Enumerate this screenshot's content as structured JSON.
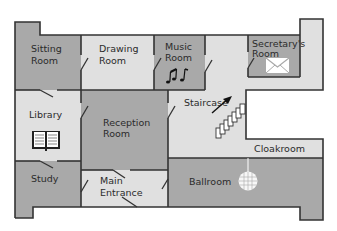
{
  "colors": {
    "wall": "#333333",
    "dark_room": "#a9a9a9",
    "light_room": "#e0e0e0",
    "background": "#ffffff"
  },
  "rooms": {
    "sitting_room": {
      "line1": "Sitting",
      "line2": "Room"
    },
    "drawing_room": {
      "line1": "Drawing",
      "line2": "Room"
    },
    "music_room": {
      "line1": "Music",
      "line2": "Room"
    },
    "secretarys_room": {
      "line1": "Secretary's",
      "line2": "Room"
    },
    "library": {
      "line1": "Library"
    },
    "reception_room": {
      "line1": "Reception",
      "line2": "Room"
    },
    "staircase": {
      "line1": "Staircase"
    },
    "cloakroom": {
      "line1": "Cloakroom"
    },
    "study": {
      "line1": "Study"
    },
    "main_entrance": {
      "line1": "Main",
      "line2": "Entrance"
    },
    "ballroom": {
      "line1": "Ballroom"
    }
  },
  "icons": {
    "library": "book-icon",
    "music_room": "music-notes-icon",
    "secretarys_room": "envelope-icon",
    "staircase": "stairs-icon",
    "ballroom": "disco-ball-icon"
  }
}
